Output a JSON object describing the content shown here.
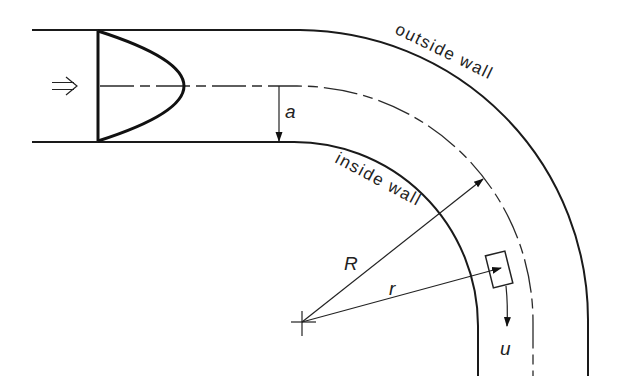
{
  "diagram": {
    "labels": {
      "outside_wall": "outside wall",
      "inside_wall": "inside wall",
      "radius_of_curvature": "R",
      "local_radius": "r",
      "pipe_radius": "a",
      "velocity": "u",
      "inflow_arrow": "⇒"
    },
    "elements": [
      {
        "name": "straight-inlet-pipe",
        "description": "horizontal pipe section with walls"
      },
      {
        "name": "velocity-profile",
        "description": "parabolic (Poiseuille) velocity profile at inlet"
      },
      {
        "name": "centerline",
        "description": "dash-dot pipe axis following the bend"
      },
      {
        "name": "bend",
        "description": "90-degree curved section turning downward"
      },
      {
        "name": "fluid-element",
        "description": "small rectangular fluid element at radius r moving with velocity u"
      },
      {
        "name": "center-of-curvature",
        "description": "cross mark at bend center"
      }
    ],
    "colors": {
      "stroke": "#1a1a1a",
      "background": "#ffffff"
    }
  }
}
